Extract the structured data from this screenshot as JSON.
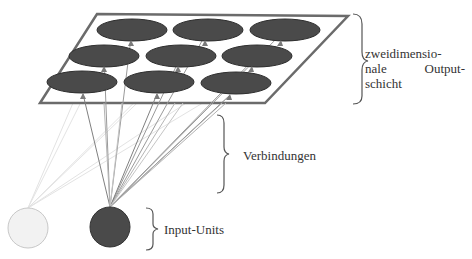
{
  "labels": {
    "output_layer": {
      "line1": "zweidimensio-",
      "line2_left": "nale",
      "line2_right": "Output-",
      "line3": "schicht"
    },
    "connections": "Verbindungen",
    "input_units": "Input-Units"
  },
  "colors": {
    "node_fill": "#4a4a4a",
    "node_stroke": "#2f2f2f",
    "plane_stroke": "#6b6b6b",
    "active_input": "#4a4a4a",
    "inactive_input": "#f2f2f2",
    "connection_active": "#7a7a7a",
    "connection_faint": "#e0e0e0",
    "brace": "#555555"
  },
  "output_grid": {
    "rows": 3,
    "cols": 3,
    "nodes": [
      {
        "row": 0,
        "col": 0,
        "cx": 132,
        "cy": 30
      },
      {
        "row": 0,
        "col": 1,
        "cx": 208,
        "cy": 30
      },
      {
        "row": 0,
        "col": 2,
        "cx": 285,
        "cy": 30
      },
      {
        "row": 1,
        "col": 0,
        "cx": 104,
        "cy": 56
      },
      {
        "row": 1,
        "col": 1,
        "cx": 181,
        "cy": 56
      },
      {
        "row": 1,
        "col": 2,
        "cx": 257,
        "cy": 56
      },
      {
        "row": 2,
        "col": 0,
        "cx": 82,
        "cy": 82
      },
      {
        "row": 2,
        "col": 1,
        "cx": 159,
        "cy": 82
      },
      {
        "row": 2,
        "col": 2,
        "cx": 236,
        "cy": 83
      }
    ]
  },
  "input_units": [
    {
      "name": "inactive",
      "cx": 28,
      "cy": 228,
      "r": 20
    },
    {
      "name": "active",
      "cx": 110,
      "cy": 227,
      "r": 20
    }
  ]
}
